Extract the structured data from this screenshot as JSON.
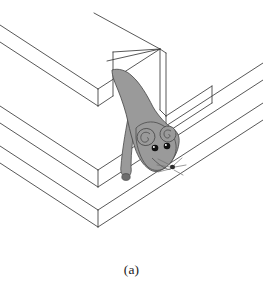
{
  "figure": {
    "caption": "(a)",
    "title": "Isometric line drawing of a staircase with a mouse emerging from an opening in the top step",
    "subject": "mouse",
    "scene": "staircase",
    "style": "line-drawing",
    "colors": {
      "background": "#ffffff",
      "outline": "#3a3a3a",
      "mouse_body_fill": "#9a9a9a",
      "mouse_outline": "#4a4a4a",
      "mouse_eye": "#111111",
      "mouse_eye_highlight": "#ffffff",
      "mouse_paw": "#6e6e6e",
      "mouse_nose": "#2b2b2b",
      "whisker": "#707070",
      "caption_text": "#1b1b1b"
    },
    "parts": {
      "step_top_label": "top step",
      "step_middle_label": "middle step",
      "step_bottom_label": "bottom step",
      "opening_label": "doorway opening",
      "mouse_label": "mouse",
      "mouse_head_label": "mouse head",
      "mouse_body_label": "mouse body",
      "mouse_ear_left_label": "mouse left ear",
      "mouse_ear_right_label": "mouse right ear",
      "mouse_eye_left_label": "mouse left eye",
      "mouse_eye_right_label": "mouse right eye",
      "mouse_foreleg_label": "mouse foreleg",
      "mouse_snout_label": "mouse snout",
      "whiskers_label": "mouse whiskers"
    },
    "geometry": {
      "step_count": 3,
      "projection": "isometric",
      "opening_count": 1
    }
  }
}
